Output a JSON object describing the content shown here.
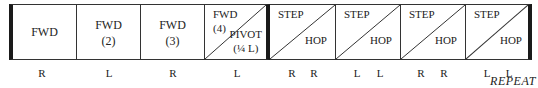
{
  "diagram": {
    "boxes": [
      {
        "type": "single",
        "lines": [
          "FWD"
        ]
      },
      {
        "type": "single",
        "lines": [
          "FWD",
          "(2)"
        ]
      },
      {
        "type": "single",
        "lines": [
          "FWD",
          "(3)"
        ]
      },
      {
        "type": "split",
        "top": [
          "FWD",
          "(4)"
        ],
        "bottom": [
          "PIVOT",
          "(¼ L)"
        ]
      },
      {
        "type": "split",
        "top": [
          "STEP"
        ],
        "bottom": [
          "HOP"
        ]
      },
      {
        "type": "split",
        "top": [
          "STEP"
        ],
        "bottom": [
          "HOP"
        ]
      },
      {
        "type": "split",
        "top": [
          "STEP"
        ],
        "bottom": [
          "HOP"
        ]
      },
      {
        "type": "split",
        "top": [
          "STEP"
        ],
        "bottom": [
          "HOP"
        ]
      }
    ],
    "footers": [
      [
        "R"
      ],
      [
        "L"
      ],
      [
        "R"
      ],
      [
        "L"
      ],
      [
        "R",
        "R"
      ],
      [
        "L",
        "L"
      ],
      [
        "R",
        "R"
      ],
      [
        "L",
        "L"
      ]
    ],
    "repeat_label": "REPEAT"
  }
}
